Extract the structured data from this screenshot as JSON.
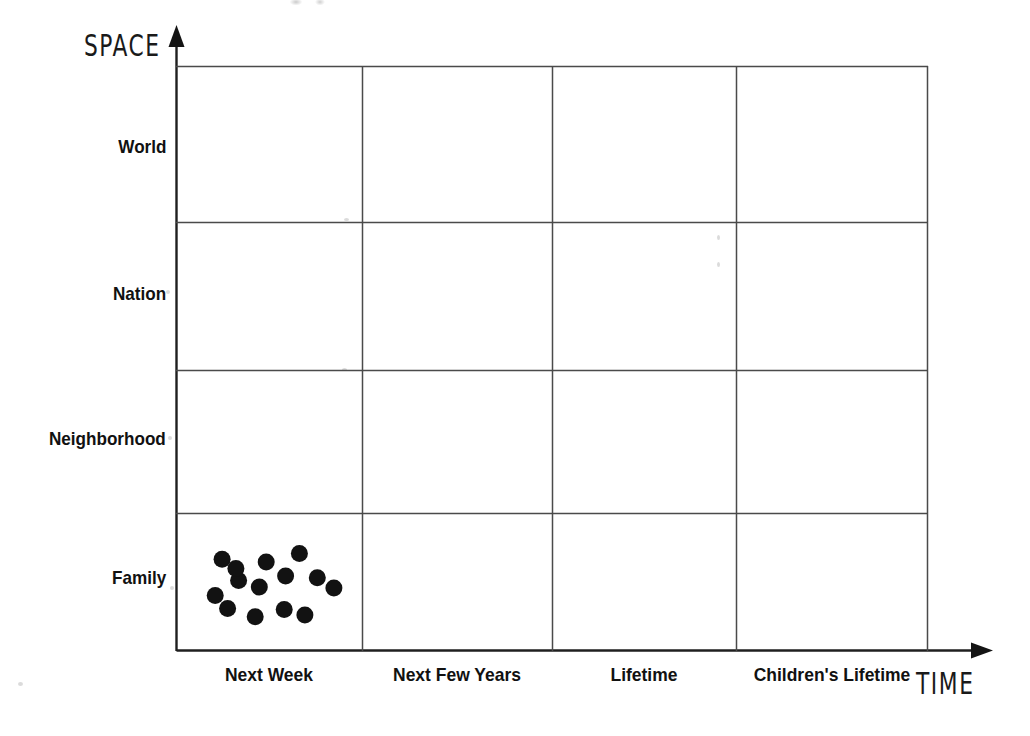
{
  "figure": {
    "caption_cut_off": "",
    "background_color": "#ffffff",
    "ink_color": "#111111",
    "grid_line_color": "#4a4a4a",
    "dot_color": "#121212"
  },
  "axes": {
    "y_title": "SPACE",
    "x_title": "TIME",
    "y_tick_labels": [
      "World",
      "Nation",
      "Neighborhood",
      "Family"
    ],
    "x_tick_labels": [
      "Next Week",
      "Next Few Years",
      "Lifetime",
      "Children's Lifetime"
    ]
  },
  "chart_data": {
    "type": "scatter",
    "title": "",
    "subtitle": "",
    "xlabel": "TIME",
    "ylabel": "SPACE",
    "grid": true,
    "legend": "none",
    "x_categories": [
      "Next Week",
      "Next Few Years",
      "Lifetime",
      "Children's Lifetime"
    ],
    "y_categories": [
      "Family",
      "Neighborhood",
      "Nation",
      "World"
    ],
    "y_categories_top_to_bottom": [
      "World",
      "Nation",
      "Neighborhood",
      "Family"
    ],
    "xlim": [
      0,
      4
    ],
    "ylim": [
      0,
      4
    ],
    "point_count": 14,
    "series": [
      {
        "name": "attention",
        "marker": "filled-circle",
        "color": "#121212",
        "marker_size_px": 17,
        "points": [
          {
            "x_category": "Next Week",
            "y_category": "Family",
            "x": 0.16,
            "y": 0.74
          },
          {
            "x_category": "Next Week",
            "y_category": "Family",
            "x": 0.48,
            "y": 0.71
          },
          {
            "x_category": "Next Week",
            "y_category": "Family",
            "x": 0.72,
            "y": 0.8
          },
          {
            "x_category": "Next Week",
            "y_category": "Family",
            "x": 0.62,
            "y": 0.56
          },
          {
            "x_category": "Next Week",
            "y_category": "Family",
            "x": 0.85,
            "y": 0.54
          },
          {
            "x_category": "Next Week",
            "y_category": "Family",
            "x": 0.28,
            "y": 0.51
          },
          {
            "x_category": "Next Week",
            "y_category": "Family",
            "x": 0.43,
            "y": 0.44
          },
          {
            "x_category": "Next Week",
            "y_category": "Family",
            "x": 0.97,
            "y": 0.43
          },
          {
            "x_category": "Next Week",
            "y_category": "Family",
            "x": 0.11,
            "y": 0.35
          },
          {
            "x_category": "Next Week",
            "y_category": "Family",
            "x": 0.2,
            "y": 0.21
          },
          {
            "x_category": "Next Week",
            "y_category": "Family",
            "x": 0.4,
            "y": 0.12
          },
          {
            "x_category": "Next Week",
            "y_category": "Family",
            "x": 0.61,
            "y": 0.2
          },
          {
            "x_category": "Next Week",
            "y_category": "Family",
            "x": 0.76,
            "y": 0.14
          },
          {
            "x_category": "Next Week",
            "y_category": "Family",
            "x": 0.26,
            "y": 0.64
          }
        ]
      }
    ],
    "annotation": "All 14 points fall in the 'Next Week' x 'Family' cell"
  }
}
